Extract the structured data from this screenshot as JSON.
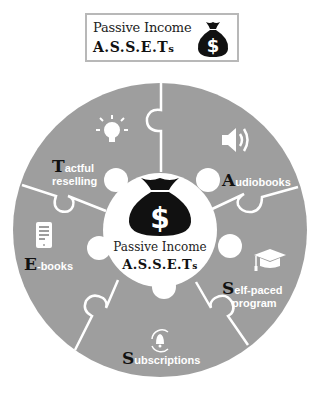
{
  "header": {
    "title": "Passive Income",
    "acronym_main": "A.S.S.E.T",
    "acronym_suffix": "s",
    "icon": "money-bag-icon"
  },
  "center": {
    "icon": "money-bag-icon",
    "title": "Passive Income",
    "acronym_main": "A.S.S.E.T",
    "acronym_suffix": "s"
  },
  "segments": [
    {
      "letter": "T",
      "rest_line1": "actful",
      "line2": "reselling",
      "icon": "lightbulb-icon"
    },
    {
      "letter": "A",
      "rest_line1": "udiobooks",
      "line2": "",
      "icon": "speaker-icon"
    },
    {
      "letter": "S",
      "rest_line1": "elf-paced",
      "line2": "program",
      "icon": "graduation-cap-icon"
    },
    {
      "letter": "S",
      "rest_line1": "ubscriptions",
      "line2": "",
      "icon": "bell-refresh-icon"
    },
    {
      "letter": "E",
      "rest_line1": "-books",
      "line2": "",
      "icon": "tablet-icon"
    }
  ],
  "colors": {
    "segment_fill": "#9e9e9e",
    "divider": "#ffffff",
    "center_fill": "#ffffff",
    "icon_dark": "#111111",
    "label_text": "#ffffff"
  }
}
